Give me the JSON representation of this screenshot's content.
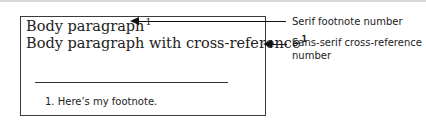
{
  "document": {
    "body_line_1": "Body paragraph",
    "body_line_1_footnote_number": "1",
    "body_line_2": "Body paragraph with cross-reference",
    "body_line_2_crossref_number": "1",
    "footnote_text": "1.  Here’s my footnote."
  },
  "annotations": [
    {
      "label": "Serif footnote number"
    },
    {
      "label": "Sans-serif cross-reference number"
    }
  ]
}
